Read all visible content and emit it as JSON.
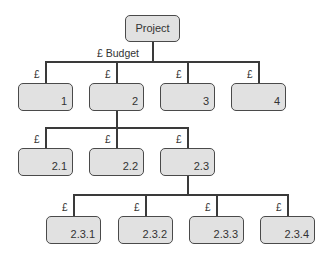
{
  "root": {
    "label": "Project",
    "edge_label": "£ Budget"
  },
  "level1": [
    {
      "label": "1",
      "edge": "£"
    },
    {
      "label": "2",
      "edge": "£"
    },
    {
      "label": "3",
      "edge": "£"
    },
    {
      "label": "4",
      "edge": "£"
    }
  ],
  "level2": [
    {
      "label": "2.1",
      "edge": "£"
    },
    {
      "label": "2.2",
      "edge": "£"
    },
    {
      "label": "2.3",
      "edge": "£"
    }
  ],
  "level3": [
    {
      "label": "2.3.1",
      "edge": "£"
    },
    {
      "label": "2.3.2",
      "edge": "£"
    },
    {
      "label": "2.3.3",
      "edge": "£"
    },
    {
      "label": "2.3.4",
      "edge": "£"
    }
  ],
  "colors": {
    "box_fill": "#e1e1e1",
    "box_border": "#4a4a4a",
    "line": "#3a3a3a"
  }
}
